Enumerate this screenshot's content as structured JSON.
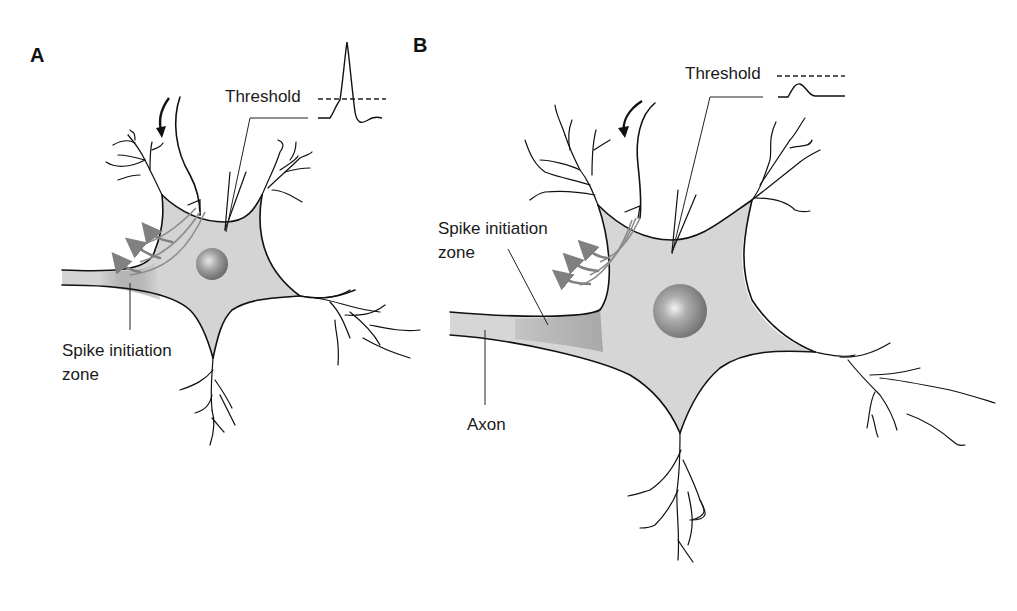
{
  "figure": {
    "panels": [
      {
        "id": "A",
        "label": "A",
        "threshold_label": "Threshold",
        "spike_zone_label_line1": "Spike initiation",
        "spike_zone_label_line2": "zone",
        "trace": "action-potential-exceeds-threshold"
      },
      {
        "id": "B",
        "label": "B",
        "threshold_label": "Threshold",
        "spike_zone_label_line1": "Spike initiation",
        "spike_zone_label_line2": "zone",
        "axon_label": "Axon",
        "trace": "subthreshold-potential"
      }
    ],
    "colors": {
      "soma_fill": "#d4d4d4",
      "spike_zone_fill": "#b8b8b8",
      "nucleus": "#8a8a8a",
      "current_arrows": "#808080",
      "outline": "#111111"
    }
  }
}
